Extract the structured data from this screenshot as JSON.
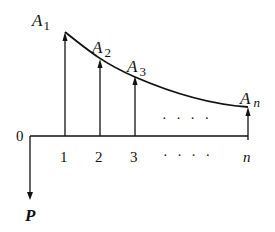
{
  "diagram": {
    "points": [
      {
        "label": "A",
        "sub": "1",
        "x_label": "1"
      },
      {
        "label": "A",
        "sub": "2",
        "x_label": "2"
      },
      {
        "label": "A",
        "sub": "3",
        "x_label": "3"
      },
      {
        "label": "A",
        "sub": "n",
        "x_label": "n"
      }
    ],
    "origin_label": "0",
    "force_label": "P",
    "ellipsis_upper": "· · · ·",
    "ellipsis_lower": "· · · ·",
    "colors": {
      "line": "#111111",
      "background": "#ffffff"
    }
  }
}
